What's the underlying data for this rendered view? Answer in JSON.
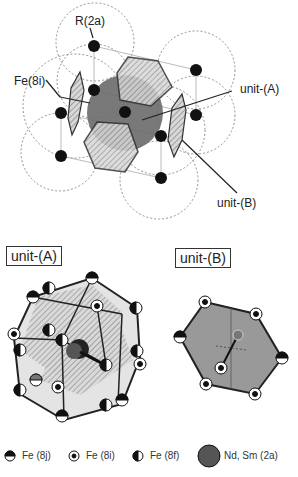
{
  "top": {
    "labels": {
      "r2a": "R(2a)",
      "fe8i": "Fe(8i)",
      "unit_a": "unit-(A)",
      "unit_b": "unit-(B)"
    }
  },
  "bottom": {
    "unit_a_title": "unit-(A)",
    "unit_b_title": "unit-(B)"
  },
  "legend": [
    {
      "icon": "half-filled-top-circle",
      "label": "Fe (8j)"
    },
    {
      "icon": "dotted-circle",
      "label": "Fe (8i)"
    },
    {
      "icon": "half-filled-left-circle",
      "label": "Fe (8f)"
    },
    {
      "icon": "large-gray-circle",
      "label": "Nd, Sm (2a)"
    }
  ],
  "colors": {
    "atom": "#111111",
    "sphere": "#6a6a6a",
    "hex_fill": "#9a9a9a",
    "line": "#333333"
  }
}
